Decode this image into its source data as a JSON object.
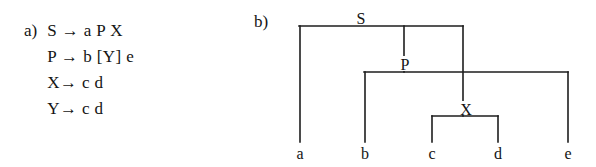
{
  "figure": {
    "width": 596,
    "height": 167,
    "background": "#ffffff",
    "ink_color": "#1d1d1d"
  },
  "part_a": {
    "label": "a)",
    "rules": [
      "S → a P X",
      "P → b [Y] e",
      "X→ c d",
      "Y→ c d"
    ]
  },
  "part_b": {
    "label": "b)",
    "tree": {
      "internal_nodes": [
        {
          "name": "S",
          "label": "S",
          "label_x": 361,
          "label_y": 22,
          "bar_y": 26,
          "bar_x1": 299,
          "bar_x2": 463
        },
        {
          "name": "P",
          "label": "P",
          "label_x": 404,
          "label_y": 68,
          "bar_y": 72,
          "bar_x1": 364,
          "bar_x2": 568
        },
        {
          "name": "X",
          "label": "X",
          "label_x": 465,
          "label_y": 113,
          "bar_y": 116,
          "bar_x1": 432,
          "bar_x2": 498
        }
      ],
      "leaves": [
        {
          "name": "a",
          "label": "a",
          "x": 300,
          "label_y": 159,
          "from_y": 26
        },
        {
          "name": "b",
          "label": "b",
          "x": 365,
          "label_y": 159,
          "from_y": 72
        },
        {
          "name": "c",
          "label": "c",
          "x": 432,
          "label_y": 159,
          "from_y": 116
        },
        {
          "name": "d",
          "label": "d",
          "x": 498,
          "label_y": 159,
          "from_y": 116
        },
        {
          "name": "e",
          "label": "e",
          "x": 568,
          "label_y": 159,
          "from_y": 72
        }
      ],
      "connectors": [
        {
          "name": "s-to-p",
          "x": 404,
          "y1": 26,
          "y2": 72
        },
        {
          "name": "s-to-x",
          "x": 463,
          "y1": 26,
          "y2": 116
        }
      ],
      "leaf_baseline_y": 142
    }
  }
}
